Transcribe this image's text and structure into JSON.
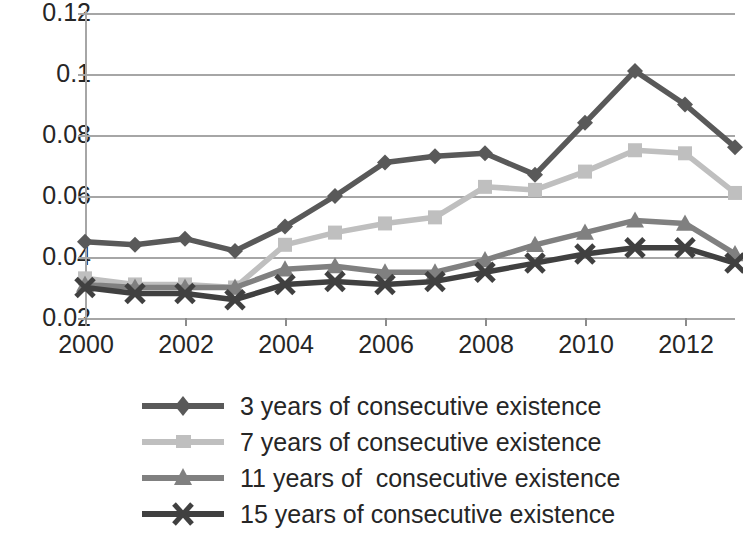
{
  "chart_data": {
    "type": "line",
    "title": "",
    "subtitle": "",
    "xlabel": "",
    "ylabel": "",
    "xlim": [
      2000,
      2013
    ],
    "ylim": [
      0.02,
      0.12
    ],
    "y_ticks": [
      "0.02",
      "0.04",
      "0.06",
      "0.08",
      "0.1",
      "0.12"
    ],
    "y_tick_values": [
      0.02,
      0.04,
      0.06,
      0.08,
      0.1,
      0.12
    ],
    "x_ticks": [
      "2000",
      "2002",
      "2004",
      "2006",
      "2008",
      "2010",
      "2012"
    ],
    "x_tick_values": [
      2000,
      2002,
      2004,
      2006,
      2008,
      2010,
      2012
    ],
    "x": [
      2000,
      2001,
      2002,
      2003,
      2004,
      2005,
      2006,
      2007,
      2008,
      2009,
      2010,
      2011,
      2012,
      2013
    ],
    "grid": "horizontal",
    "legend_position": "bottom",
    "series": [
      {
        "name": "3 years of consecutive existence",
        "marker": "diamond",
        "color": "#595959",
        "values": [
          0.045,
          0.044,
          0.046,
          0.042,
          0.05,
          0.06,
          0.071,
          0.073,
          0.074,
          0.067,
          0.084,
          0.101,
          0.09,
          0.076
        ]
      },
      {
        "name": "7 years of consecutive existence",
        "marker": "square",
        "color": "#bfbfbf",
        "values": [
          0.033,
          0.031,
          0.031,
          0.03,
          0.044,
          0.048,
          0.051,
          0.053,
          0.063,
          0.062,
          0.068,
          0.075,
          0.074,
          0.061
        ]
      },
      {
        "name": "11 years of  consecutive existence",
        "marker": "triangle",
        "color": "#808080",
        "values": [
          0.031,
          0.03,
          0.03,
          0.03,
          0.036,
          0.037,
          0.035,
          0.035,
          0.039,
          0.044,
          0.048,
          0.052,
          0.051,
          0.041
        ]
      },
      {
        "name": "15 years of consecutive existence",
        "marker": "x",
        "color": "#404040",
        "values": [
          0.03,
          0.028,
          0.028,
          0.026,
          0.031,
          0.032,
          0.031,
          0.032,
          0.035,
          0.038,
          0.041,
          0.043,
          0.043,
          0.038
        ]
      }
    ]
  },
  "legend": {
    "items": [
      {
        "label": "3 years of consecutive existence"
      },
      {
        "label": "7 years of consecutive existence"
      },
      {
        "label": "11 years of  consecutive existence"
      },
      {
        "label": "15 years of consecutive existence"
      }
    ]
  },
  "axes": {
    "y_labels": [
      "0.12",
      "0.1",
      "0.08",
      "0.06",
      "0.04",
      "0.02"
    ],
    "x_labels": [
      "2000",
      "2002",
      "2004",
      "2006",
      "2008",
      "2010",
      "2012"
    ]
  }
}
